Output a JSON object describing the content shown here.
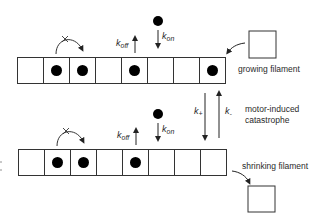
{
  "diagram": {
    "title": "",
    "colors": {
      "stroke": "#333333",
      "fill_dot": "#000000",
      "background": "#ffffff"
    },
    "growing_filament": {
      "label": "growing filament",
      "cells": [
        false,
        true,
        true,
        false,
        true,
        false,
        false,
        true
      ],
      "cap_label": ""
    },
    "shrinking_filament": {
      "label": "shrinking filament",
      "cells": [
        false,
        true,
        true,
        false,
        true,
        false,
        false,
        false
      ]
    },
    "transition": {
      "line1": "motor-induced",
      "line2": "catastrophe",
      "k_plus": {
        "base": "k",
        "sub": "+"
      },
      "k_minus": {
        "base": "k",
        "sub": "-"
      }
    },
    "rates": {
      "k_off": {
        "base": "k",
        "sub": "off"
      },
      "k_on": {
        "base": "k",
        "sub": "on"
      }
    },
    "hop_blocked_marker": "x"
  }
}
